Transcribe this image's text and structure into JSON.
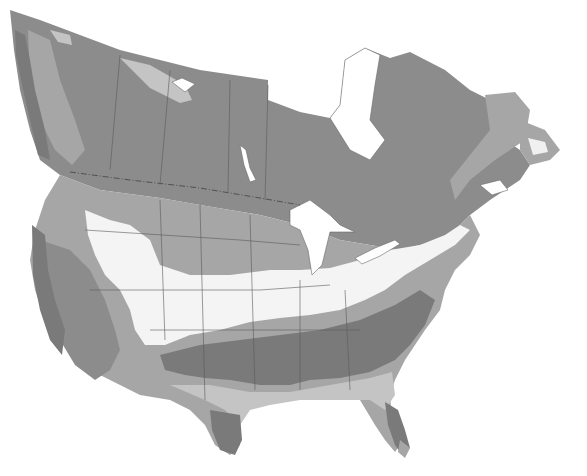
{
  "map": {
    "type": "zone-map",
    "region": "North America (Canada, United States)",
    "style": "grayscale shaded zones",
    "has_text": false,
    "palette": {
      "background": "#ffffff",
      "zone_darkest": "#7a7a7a",
      "zone_dark": "#8c8c8c",
      "zone_medium": "#a6a6a6",
      "zone_light": "#c4c4c4",
      "zone_lightest": "#f4f4f4",
      "water": "#ffffff",
      "borders": "#5a5a5a"
    },
    "zones": [
      {
        "name": "northern-canada",
        "shade": "zone_dark"
      },
      {
        "name": "arctic-light-patch",
        "shade": "zone_light"
      },
      {
        "name": "labrador-coast",
        "shade": "zone_light"
      },
      {
        "name": "northern-plains",
        "shade": "zone_medium"
      },
      {
        "name": "central-band",
        "shade": "zone_lightest"
      },
      {
        "name": "mid-south-band",
        "shade": "zone_medium"
      },
      {
        "name": "deep-south-band",
        "shade": "zone_darkest"
      },
      {
        "name": "gulf-coast",
        "shade": "zone_light"
      },
      {
        "name": "florida-peninsula",
        "shade": "zone_darkest"
      },
      {
        "name": "west-coast",
        "shade": "zone_dark"
      }
    ],
    "water_bodies": [
      "hudson-bay",
      "great-lakes",
      "great-bear-lake",
      "great-slave-lake",
      "lake-winnipeg",
      "gulf-of-st-lawrence"
    ]
  }
}
